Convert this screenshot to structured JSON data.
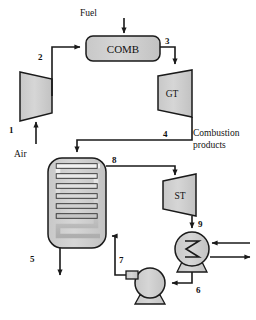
{
  "diagram": {
    "type": "process-flow",
    "colors": {
      "equipment_fill": "#cfcfcf",
      "equipment_fill_light": "#d9d9d9",
      "line": "#1a1a1a",
      "text": "#111111",
      "background": "#ffffff"
    }
  },
  "equipment": {
    "compressor": {
      "label": "",
      "shape": "trapezoid-expanding-right"
    },
    "combustor": {
      "label": "COMB",
      "shape": "rounded-rectangle"
    },
    "gas_turbine": {
      "label": "GT",
      "shape": "trapezoid-expanding-right"
    },
    "hrsg": {
      "label": "",
      "shape": "rounded-vessel-with-serpentine-coil",
      "coil_passes": 6
    },
    "steam_turbine": {
      "label": "ST",
      "shape": "trapezoid-expanding-right"
    },
    "condenser": {
      "label": "",
      "shape": "circle-with-zigzag-on-pedestal"
    },
    "pump": {
      "label": "",
      "shape": "circle-with-inlet-stub-on-pedestal"
    }
  },
  "stream_labels": [
    {
      "id": "s1",
      "text": "1"
    },
    {
      "id": "s2",
      "text": "2"
    },
    {
      "id": "s3",
      "text": "3"
    },
    {
      "id": "s4",
      "text": "4"
    },
    {
      "id": "s5",
      "text": "5"
    },
    {
      "id": "s6",
      "text": "6"
    },
    {
      "id": "s7",
      "text": "7"
    },
    {
      "id": "s8",
      "text": "8"
    },
    {
      "id": "s9",
      "text": "9"
    }
  ],
  "text_labels": {
    "fuel": "Fuel",
    "air": "Air",
    "combustion_products_line1": "Combustion",
    "combustion_products_line2": "products"
  }
}
